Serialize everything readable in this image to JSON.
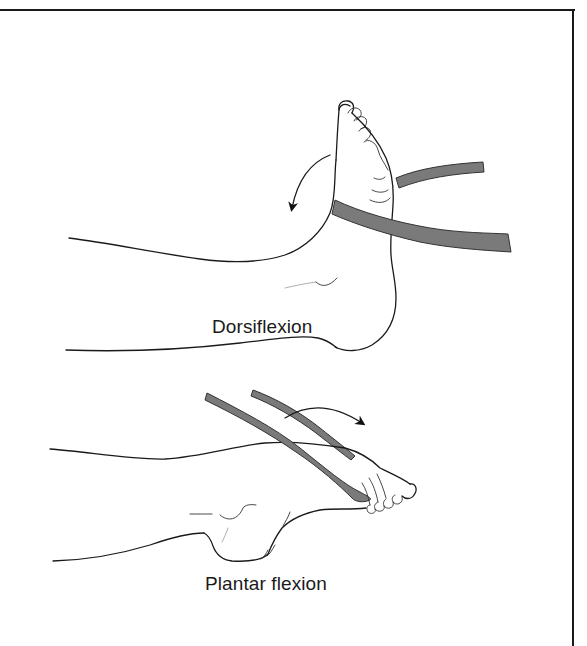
{
  "figure": {
    "panels": [
      {
        "id": "dorsiflexion",
        "label": "Dorsiflexion",
        "motion": "foot pulled upward toward shin against resistance band",
        "arrow_direction": "counterclockwise-down"
      },
      {
        "id": "plantar_flexion",
        "label": "Plantar flexion",
        "motion": "foot pushed downward away from shin against resistance band",
        "arrow_direction": "clockwise-right"
      }
    ],
    "colors": {
      "line": "#1a1a1a",
      "band_fill": "#7a7a7a",
      "background": "#ffffff",
      "frame": "#1a1a1a"
    }
  }
}
